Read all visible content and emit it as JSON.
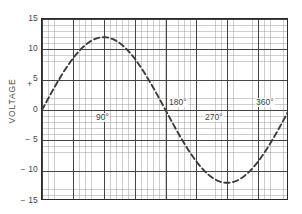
{
  "figure": {
    "kind": "sine-voltage-graph",
    "y_axis_title": "VOLTAGE",
    "polarity_marker": "+"
  },
  "chart_data": {
    "type": "line",
    "title": "",
    "xlabel": "",
    "ylabel": "VOLTAGE",
    "xlim": [
      0,
      360
    ],
    "ylim": [
      -15,
      15
    ],
    "grid": true,
    "legend": null,
    "x_major_step": 45,
    "y_major_step": 5,
    "x_minor_step": 9,
    "y_minor_step": 1,
    "line_style": "dashed",
    "line_color": "#3c3c3c",
    "amplitude": 12,
    "x_tick_labels": [
      "90°",
      "180°",
      "270°",
      "360°"
    ],
    "x_tick_values": [
      90,
      180,
      270,
      360
    ],
    "y_tick_labels": [
      "15",
      "10",
      "5",
      "0",
      "− 5",
      "− 10",
      "− 15"
    ],
    "y_tick_values": [
      15,
      10,
      5,
      0,
      -5,
      -10,
      -15
    ],
    "x": [
      0,
      15,
      30,
      45,
      60,
      75,
      90,
      105,
      120,
      135,
      150,
      165,
      180,
      195,
      210,
      225,
      240,
      255,
      270,
      285,
      300,
      315,
      330,
      345,
      360
    ],
    "values": [
      0,
      3.11,
      6.0,
      8.49,
      10.39,
      11.59,
      12.0,
      11.59,
      10.39,
      8.49,
      6.0,
      3.11,
      0,
      -3.11,
      -6.0,
      -8.49,
      -10.39,
      -11.59,
      -12.0,
      -11.59,
      -10.39,
      -8.49,
      -6.0,
      -3.11,
      0
    ],
    "annotations": [
      {
        "text": "90°",
        "x": 90,
        "y": 0,
        "placement": "below-right-of-axis"
      },
      {
        "text": "180°",
        "x": 180,
        "y": 0,
        "placement": "above-right-of-axis"
      },
      {
        "text": "270°",
        "x": 270,
        "y": 0,
        "placement": "below-right-of-axis"
      },
      {
        "text": "360°",
        "x": 360,
        "y": 0,
        "placement": "above-left-of-axis"
      }
    ]
  },
  "colors": {
    "frame": "#2b2b2b",
    "major_grid": "#373737",
    "minor_grid": "#8c8c8c",
    "curve": "#3c3c3c",
    "text": "#4a4a4a",
    "background": "#ffffff"
  }
}
